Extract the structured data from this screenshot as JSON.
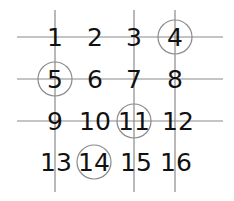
{
  "diagram": {
    "grid_numbers": [
      [
        "1",
        "2",
        "3",
        "4"
      ],
      [
        "5",
        "6",
        "7",
        "8"
      ],
      [
        "9",
        "10",
        "11",
        "12"
      ],
      [
        "13",
        "14",
        "15",
        "16"
      ]
    ],
    "circled": [
      "4",
      "5",
      "11",
      "14"
    ],
    "vertical_lines_through_columns": [
      1,
      3,
      4
    ],
    "horizontal_lines_through_rows": [
      1,
      2,
      3
    ],
    "colors": {
      "line": "#8a8a8a",
      "circle": "#8a8a8a",
      "text": "#111111",
      "background": "#ffffff"
    }
  }
}
